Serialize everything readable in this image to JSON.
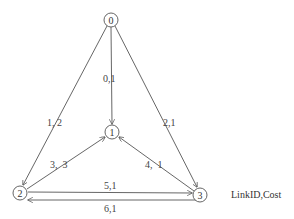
{
  "diagram": {
    "type": "directed-graph",
    "legend": "LinkID,Cost",
    "nodes": [
      {
        "id": "0",
        "label": "0",
        "x": 111,
        "y": 20
      },
      {
        "id": "1",
        "label": "1",
        "x": 112,
        "y": 132
      },
      {
        "id": "2",
        "label": "2",
        "x": 20,
        "y": 193
      },
      {
        "id": "3",
        "label": "3",
        "x": 200,
        "y": 195
      }
    ],
    "edges": [
      {
        "from": "0",
        "to": "1",
        "link_id": 0,
        "cost": 1,
        "label": "0,1"
      },
      {
        "from": "0",
        "to": "2",
        "link_id": 1,
        "cost": 2,
        "label": "1, 2"
      },
      {
        "from": "0",
        "to": "3",
        "link_id": 2,
        "cost": 1,
        "label": "2,1"
      },
      {
        "from": "2",
        "to": "1",
        "link_id": 3,
        "cost": 3,
        "label": "3,  3"
      },
      {
        "from": "3",
        "to": "1",
        "link_id": 4,
        "cost": 1,
        "label": "4,  1"
      },
      {
        "from": "2",
        "to": "3",
        "link_id": 5,
        "cost": 1,
        "label": "5,1"
      },
      {
        "from": "3",
        "to": "2",
        "link_id": 6,
        "cost": 1,
        "label": "6,1"
      }
    ]
  }
}
